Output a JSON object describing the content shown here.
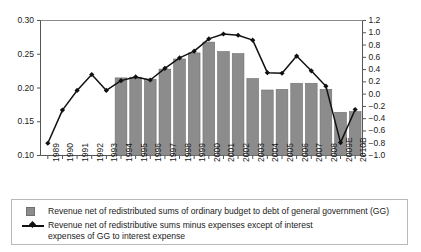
{
  "chart_data": {
    "type": "bar",
    "title": "",
    "subtitle": "",
    "xlabel": "",
    "ylabel": "",
    "grid": false,
    "legend_position": "bottom",
    "categories": [
      "1989",
      "1990",
      "1991",
      "1992",
      "1993",
      "1994",
      "1995",
      "1996",
      "1997",
      "1998",
      "1999",
      "2000",
      "2001",
      "2002",
      "2003",
      "2004",
      "2005",
      "2006",
      "2007",
      "2008",
      "2009E",
      "2010B"
    ],
    "left_axis": {
      "label": "",
      "ylim": [
        0.1,
        0.3
      ],
      "ticks": [
        0.1,
        0.15,
        0.2,
        0.25,
        0.3
      ],
      "tick_labels": [
        "0.10",
        "0.15",
        "0.20",
        "0.25",
        "0.30"
      ]
    },
    "right_axis": {
      "label": "",
      "ylim": [
        -1.0,
        1.2
      ],
      "ticks": [
        -1.0,
        -0.8,
        -0.6,
        -0.4,
        -0.2,
        0.0,
        0.2,
        0.4,
        0.6,
        0.8,
        1.0,
        1.2
      ],
      "tick_labels": [
        "−1.0",
        "−0.8",
        "−0.6",
        "−0.4",
        "−0.2",
        "0.0",
        "0.2",
        "0.4",
        "0.6",
        "0.8",
        "1.0",
        "1.2"
      ]
    },
    "series": [
      {
        "name": "Revenue net of redistributed sums of ordinary budget to debt of general government (GG)",
        "type": "bar",
        "axis": "left",
        "color": "#8c8c8c",
        "values": [
          null,
          null,
          null,
          null,
          null,
          0.215,
          0.216,
          0.213,
          0.228,
          0.243,
          0.252,
          0.268,
          0.254,
          0.251,
          0.214,
          0.197,
          0.198,
          0.207,
          0.207,
          0.198,
          0.164,
          0.165
        ]
      },
      {
        "name": "Revenue net of redistributive sums minus expenses except of interest expenses of GG to interest expense",
        "type": "line",
        "axis": "right",
        "color": "#111111",
        "marker": "diamond",
        "values": [
          -0.8,
          -0.26,
          0.06,
          0.32,
          0.06,
          0.22,
          0.28,
          0.23,
          0.42,
          0.59,
          0.7,
          0.9,
          0.98,
          0.96,
          0.88,
          0.35,
          0.34,
          0.62,
          0.38,
          0.13,
          -0.79,
          -0.25
        ]
      }
    ]
  },
  "legend": {
    "bar_label": "Revenue net of redistributed sums of ordinary budget to debt of general government (GG)",
    "line_label_line1": "Revenue net of redistributive sums minus expenses except of interest",
    "line_label_line2": "expenses of GG to interest expense"
  },
  "colors": {
    "bar_fill": "#8c8c8c",
    "bar_stroke": "#6f6f6f",
    "line": "#111111",
    "axis": "#555555",
    "legend_border": "#b9b9b9",
    "background": "#ffffff"
  }
}
